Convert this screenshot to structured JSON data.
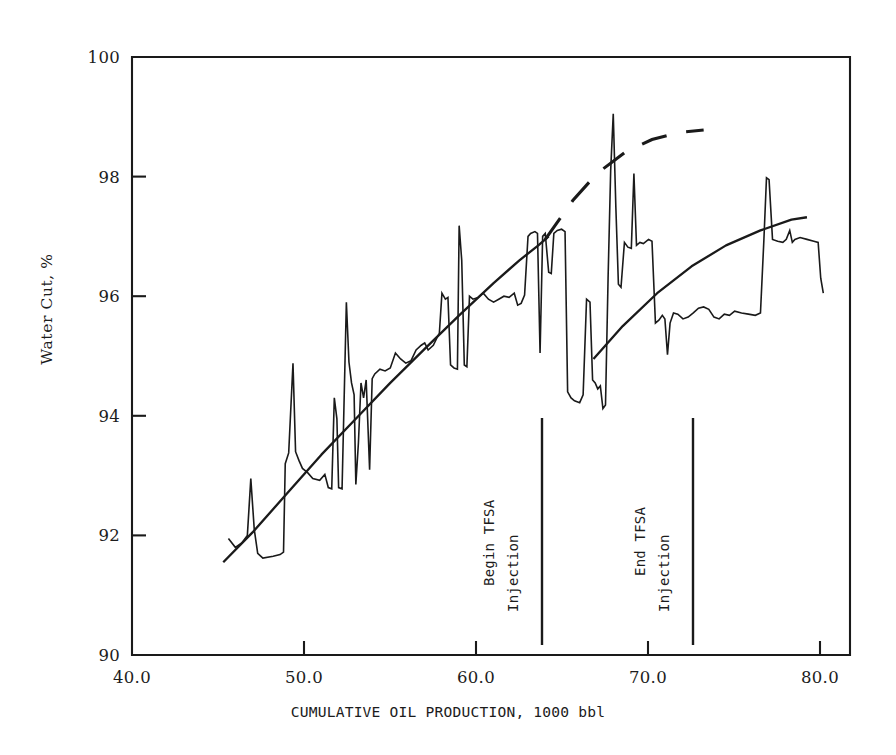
{
  "figure": {
    "background_color": "#ffffff",
    "ink_color": "#1a1a1a"
  },
  "axes": {
    "y_label": "Water Cut, %",
    "x_label": "CUMULATIVE OIL PRODUCTION,  1000 bbl",
    "y_ticks": [
      "100",
      "98",
      "96",
      "94",
      "92",
      "90"
    ],
    "x_ticks": [
      "40.0",
      "50.0",
      "60.0",
      "70.0",
      "80.0"
    ]
  },
  "annotations": [
    {
      "name": "begin-tfsa",
      "line1": "Begin TFSA",
      "line2": "Injection",
      "x_value": 63.8
    },
    {
      "name": "end-tfsa",
      "line1": "End TFSA",
      "line2": "Injection",
      "x_value": 72.5
    }
  ],
  "chart_data": {
    "type": "line",
    "title": "",
    "xlabel": "CUMULATIVE OIL PRODUCTION,  1000 bbl",
    "ylabel": "Water Cut, %",
    "xlim": [
      40.0,
      81.7
    ],
    "ylim": [
      90,
      100
    ],
    "grid": false,
    "legend": null,
    "xticks": [
      40.0,
      50.0,
      60.0,
      70.0,
      80.0
    ],
    "yticks": [
      90,
      92,
      94,
      96,
      98,
      100
    ],
    "series": [
      {
        "name": "Water cut field data",
        "style": "solid-jagged",
        "points": [
          [
            45.6,
            91.95
          ],
          [
            46.0,
            91.8
          ],
          [
            46.4,
            91.88
          ],
          [
            46.7,
            92.0
          ],
          [
            46.9,
            92.95
          ],
          [
            47.1,
            92.1
          ],
          [
            47.3,
            91.7
          ],
          [
            47.6,
            91.62
          ],
          [
            48.2,
            91.65
          ],
          [
            48.6,
            91.68
          ],
          [
            48.8,
            91.72
          ],
          [
            48.9,
            93.2
          ],
          [
            49.1,
            93.38
          ],
          [
            49.35,
            94.88
          ],
          [
            49.5,
            93.4
          ],
          [
            49.7,
            93.25
          ],
          [
            49.9,
            93.12
          ],
          [
            50.2,
            93.05
          ],
          [
            50.5,
            92.95
          ],
          [
            50.9,
            92.92
          ],
          [
            51.2,
            93.02
          ],
          [
            51.4,
            92.8
          ],
          [
            51.6,
            92.78
          ],
          [
            51.75,
            94.3
          ],
          [
            51.9,
            93.95
          ],
          [
            52.0,
            92.8
          ],
          [
            52.2,
            92.78
          ],
          [
            52.45,
            95.9
          ],
          [
            52.6,
            94.9
          ],
          [
            52.75,
            94.55
          ],
          [
            52.9,
            94.35
          ],
          [
            53.0,
            92.85
          ],
          [
            53.15,
            93.55
          ],
          [
            53.3,
            94.55
          ],
          [
            53.45,
            94.3
          ],
          [
            53.6,
            94.6
          ],
          [
            53.8,
            93.1
          ],
          [
            53.95,
            94.62
          ],
          [
            54.1,
            94.7
          ],
          [
            54.4,
            94.78
          ],
          [
            54.7,
            94.75
          ],
          [
            55.0,
            94.8
          ],
          [
            55.3,
            95.05
          ],
          [
            55.6,
            94.95
          ],
          [
            55.9,
            94.88
          ],
          [
            56.2,
            94.92
          ],
          [
            56.5,
            95.1
          ],
          [
            56.8,
            95.18
          ],
          [
            57.0,
            95.22
          ],
          [
            57.2,
            95.1
          ],
          [
            57.5,
            95.18
          ],
          [
            57.7,
            95.3
          ],
          [
            57.85,
            95.38
          ],
          [
            58.0,
            96.05
          ],
          [
            58.2,
            95.95
          ],
          [
            58.35,
            95.98
          ],
          [
            58.5,
            94.85
          ],
          [
            58.7,
            94.8
          ],
          [
            58.9,
            94.78
          ],
          [
            59.0,
            97.18
          ],
          [
            59.15,
            96.6
          ],
          [
            59.3,
            94.85
          ],
          [
            59.45,
            94.82
          ],
          [
            59.6,
            96.0
          ],
          [
            59.8,
            95.95
          ],
          [
            60.1,
            95.98
          ],
          [
            60.4,
            96.05
          ],
          [
            60.7,
            95.95
          ],
          [
            61.0,
            95.9
          ],
          [
            61.3,
            95.95
          ],
          [
            61.6,
            96.0
          ],
          [
            61.9,
            95.98
          ],
          [
            62.2,
            96.05
          ],
          [
            62.4,
            95.85
          ],
          [
            62.6,
            95.88
          ],
          [
            62.8,
            96.02
          ],
          [
            63.0,
            97.0
          ],
          [
            63.15,
            97.05
          ],
          [
            63.4,
            97.08
          ],
          [
            63.55,
            97.05
          ],
          [
            63.7,
            95.05
          ],
          [
            63.85,
            97.0
          ],
          [
            64.0,
            97.05
          ],
          [
            64.2,
            96.4
          ],
          [
            64.35,
            96.38
          ],
          [
            64.5,
            97.05
          ],
          [
            64.7,
            97.1
          ],
          [
            64.95,
            97.12
          ],
          [
            65.15,
            97.08
          ],
          [
            65.3,
            94.4
          ],
          [
            65.5,
            94.3
          ],
          [
            65.7,
            94.25
          ],
          [
            66.0,
            94.22
          ],
          [
            66.2,
            94.35
          ],
          [
            66.4,
            95.95
          ],
          [
            66.6,
            95.9
          ],
          [
            66.75,
            94.6
          ],
          [
            66.9,
            94.55
          ],
          [
            67.05,
            94.45
          ],
          [
            67.2,
            94.5
          ],
          [
            67.35,
            94.12
          ],
          [
            67.5,
            94.18
          ],
          [
            67.65,
            96.3
          ],
          [
            67.8,
            98.1
          ],
          [
            67.95,
            99.05
          ],
          [
            68.1,
            97.5
          ],
          [
            68.25,
            96.2
          ],
          [
            68.4,
            96.15
          ],
          [
            68.6,
            96.9
          ],
          [
            68.8,
            96.82
          ],
          [
            69.0,
            96.8
          ],
          [
            69.15,
            98.05
          ],
          [
            69.3,
            96.85
          ],
          [
            69.5,
            96.9
          ],
          [
            69.7,
            96.88
          ],
          [
            70.0,
            96.95
          ],
          [
            70.2,
            96.92
          ],
          [
            70.4,
            95.55
          ],
          [
            70.6,
            95.6
          ],
          [
            70.8,
            95.68
          ],
          [
            70.95,
            95.62
          ],
          [
            71.1,
            95.02
          ],
          [
            71.25,
            95.55
          ],
          [
            71.45,
            95.72
          ],
          [
            71.7,
            95.7
          ],
          [
            72.0,
            95.62
          ],
          [
            72.3,
            95.65
          ],
          [
            72.6,
            95.72
          ],
          [
            72.9,
            95.8
          ],
          [
            73.2,
            95.82
          ],
          [
            73.5,
            95.78
          ],
          [
            73.8,
            95.65
          ],
          [
            74.1,
            95.62
          ],
          [
            74.4,
            95.7
          ],
          [
            74.7,
            95.68
          ],
          [
            75.0,
            95.75
          ],
          [
            75.4,
            95.72
          ],
          [
            75.8,
            95.7
          ],
          [
            76.2,
            95.68
          ],
          [
            76.5,
            95.72
          ],
          [
            76.7,
            96.95
          ],
          [
            76.85,
            97.98
          ],
          [
            77.0,
            97.95
          ],
          [
            77.2,
            96.95
          ],
          [
            77.5,
            96.92
          ],
          [
            77.8,
            96.9
          ],
          [
            78.0,
            96.95
          ],
          [
            78.2,
            97.1
          ],
          [
            78.35,
            96.9
          ],
          [
            78.5,
            96.95
          ],
          [
            78.8,
            96.98
          ],
          [
            79.2,
            96.95
          ],
          [
            79.6,
            96.92
          ],
          [
            79.85,
            96.9
          ],
          [
            80.0,
            96.3
          ],
          [
            80.15,
            96.05
          ]
        ]
      },
      {
        "name": "Trend line (solid)",
        "style": "solid-smooth",
        "points": [
          [
            45.3,
            91.55
          ],
          [
            47.0,
            92.05
          ],
          [
            49.0,
            92.7
          ],
          [
            51.0,
            93.35
          ],
          [
            53.0,
            93.95
          ],
          [
            55.0,
            94.55
          ],
          [
            57.0,
            95.12
          ],
          [
            59.0,
            95.68
          ],
          [
            61.0,
            96.22
          ],
          [
            62.5,
            96.6
          ],
          [
            63.6,
            96.85
          ],
          [
            64.2,
            97.0
          ]
        ]
      },
      {
        "name": "Trend line segment 2 (solid)",
        "style": "solid-smooth",
        "points": [
          [
            66.8,
            94.95
          ],
          [
            68.5,
            95.5
          ],
          [
            70.5,
            96.05
          ],
          [
            72.5,
            96.5
          ],
          [
            74.5,
            96.85
          ],
          [
            76.5,
            97.1
          ],
          [
            78.3,
            97.28
          ],
          [
            79.2,
            97.32
          ]
        ]
      },
      {
        "name": "Extrapolated projection (dashed)",
        "style": "dashed",
        "points": [
          [
            64.0,
            96.95
          ],
          [
            65.6,
            97.6
          ],
          [
            67.0,
            98.05
          ],
          [
            68.6,
            98.4
          ],
          [
            70.2,
            98.62
          ],
          [
            71.8,
            98.74
          ],
          [
            73.2,
            98.78
          ]
        ]
      }
    ]
  }
}
